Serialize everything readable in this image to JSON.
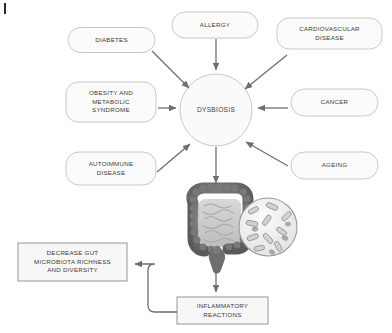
{
  "diagram": {
    "center": {
      "label": "DYSBIOSIS",
      "shape": "circle"
    },
    "factors": [
      {
        "id": "diabetes",
        "label": "DIABETES",
        "shape": "rounded-rect"
      },
      {
        "id": "allergy",
        "label": "ALLERGY",
        "shape": "rounded-rect"
      },
      {
        "id": "cardiovascular",
        "label": "CARDIOVASCULAR\nDISEASE",
        "shape": "rounded-rect"
      },
      {
        "id": "obesity",
        "label": "OBESITY AND\nMETABOLIC\nSYNDROME",
        "shape": "rounded-rect"
      },
      {
        "id": "cancer",
        "label": "CANCER",
        "shape": "rounded-rect"
      },
      {
        "id": "autoimmune",
        "label": "AUTOIMMUNE\nDISEASE",
        "shape": "rounded-rect"
      },
      {
        "id": "ageing",
        "label": "AGEING",
        "shape": "rounded-rect"
      }
    ],
    "outcomes": [
      {
        "id": "inflammatory",
        "label": "INFLAMMATORY\nREACTIONS",
        "shape": "rect"
      },
      {
        "id": "decrease",
        "label": "DECREASE GUT\nMICROBIOTA RICHNESS\nAND DIVERSITY",
        "shape": "rect"
      }
    ],
    "illustration": {
      "name": "large-intestine-with-bacteria-magnifier",
      "parts": [
        "colon",
        "small-intestine",
        "rectum",
        "magnifier-circle",
        "bacteria-rods"
      ]
    },
    "colors": {
      "node_fill": "#fbfbfb",
      "node_stroke": "#c9c9c9",
      "outcome_fill": "#f7f7f7",
      "outcome_stroke": "#8d8d8d",
      "arrow": "#6e6e6e",
      "text": "#3a3a3a",
      "colon_dark": "#6b6b6b",
      "colon_light": "#c4c4c4",
      "bacteria": "#9a9a9a"
    }
  }
}
